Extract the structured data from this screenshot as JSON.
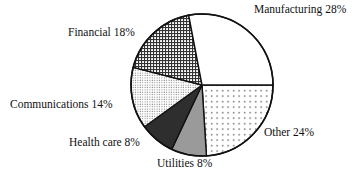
{
  "chart_data": {
    "type": "pie",
    "title": "",
    "categories": [
      "Other",
      "Utilities",
      "Health care",
      "Communications",
      "Financial",
      "Manufacturing"
    ],
    "values": [
      24,
      8,
      8,
      14,
      18,
      28
    ],
    "unit": "%",
    "slices": [
      {
        "label": "Other",
        "value": 24,
        "pattern": "sparse-dots",
        "fill": "#ffffff"
      },
      {
        "label": "Utilities",
        "value": 8,
        "pattern": "solid",
        "fill": "#9a9a9a"
      },
      {
        "label": "Health care",
        "value": 8,
        "pattern": "solid",
        "fill": "#2e2e2e"
      },
      {
        "label": "Communications",
        "value": 14,
        "pattern": "fine-dots",
        "fill": "#ffffff"
      },
      {
        "label": "Financial",
        "value": 18,
        "pattern": "crosshatch",
        "fill": "#ffffff"
      },
      {
        "label": "Manufacturing",
        "value": 28,
        "pattern": "none",
        "fill": "#ffffff"
      }
    ],
    "start_angle_deg": 0,
    "direction": "clockwise-from-3-oclock",
    "legend": "none (direct labels)"
  },
  "labels": {
    "manufacturing": "Manufacturing 28%",
    "financial": "Financial 18%",
    "communications": "Communications 14%",
    "health_care": "Health care 8%",
    "utilities": "Utilities 8%",
    "other": "Other 24%"
  }
}
